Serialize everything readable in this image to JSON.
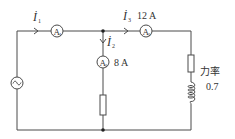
{
  "diagram": {
    "type": "ac-circuit",
    "colors": {
      "line": "#4a4a4a",
      "text": "#333333",
      "background": "#ffffff"
    },
    "source": {
      "icon": "ac-source-icon",
      "glyph": "~"
    },
    "currents": {
      "i1": {
        "symbol": "İ",
        "sub": "1"
      },
      "i2": {
        "symbol": "İ",
        "sub": "2"
      },
      "i3": {
        "symbol": "İ",
        "sub": "3"
      }
    },
    "ammeters": {
      "a1": {
        "letter": "A",
        "sub": "1"
      },
      "a2": {
        "letter": "A",
        "sub": "2",
        "reading": "8 A"
      },
      "a3": {
        "letter": "A",
        "sub": "3",
        "reading": "12 A"
      }
    },
    "right_branch": {
      "power_factor_label": "力率",
      "power_factor_value": "0.7"
    }
  }
}
